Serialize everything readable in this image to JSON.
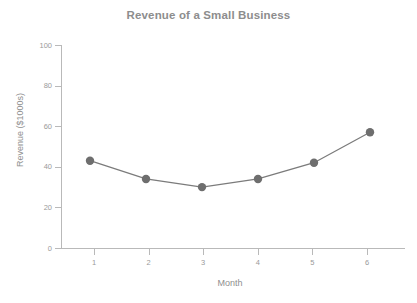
{
  "chart_data": {
    "type": "line",
    "title": "Revenue of a Small Business",
    "xlabel": "Month",
    "ylabel": "Revenue ($1000s)",
    "x": [
      1,
      2,
      3,
      4,
      5,
      6
    ],
    "categories": [
      "1",
      "2",
      "3",
      "4",
      "5",
      "6"
    ],
    "values": [
      43,
      34,
      30,
      34,
      42,
      57
    ],
    "series": [
      {
        "name": "Revenue",
        "values": [
          43,
          34,
          30,
          34,
          42,
          57
        ],
        "color": "#7b7b7b",
        "marker": "circle",
        "marker_color": "#6e6e6e"
      }
    ],
    "xlim": [
      0.5,
      6.5
    ],
    "ylim": [
      0,
      100
    ],
    "ytick_labels": [
      "0",
      "20",
      "40",
      "60",
      "80",
      "100"
    ],
    "yticks": [
      0,
      20,
      40,
      60,
      80,
      100
    ],
    "xtick_labels": [
      "1",
      "2",
      "3",
      "4",
      "5",
      "6"
    ],
    "xticks": [
      1,
      2,
      3,
      4,
      5,
      6
    ],
    "grid": false,
    "legend": false,
    "legend_position": "none",
    "axis_color": "#b9b9b9",
    "text_color": "#8f8f8f",
    "background": "#ffffff"
  }
}
